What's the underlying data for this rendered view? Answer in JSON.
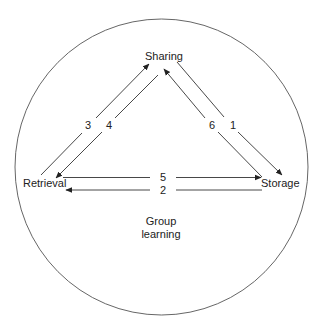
{
  "diagram": {
    "title": "Group learning",
    "boundary": {
      "shape": "circle",
      "label_line1": "Group",
      "label_line2": "learning"
    },
    "nodes": {
      "sharing": "Sharing",
      "retrieval": "Retrieval",
      "storage": "Storage"
    },
    "edges": [
      {
        "id": "1",
        "label": "1",
        "from": "Sharing",
        "to": "Storage"
      },
      {
        "id": "2",
        "label": "2",
        "from": "Storage",
        "to": "Retrieval"
      },
      {
        "id": "3",
        "label": "3",
        "from": "Retrieval",
        "to": "Sharing"
      },
      {
        "id": "4",
        "label": "4",
        "from": "Sharing",
        "to": "Retrieval"
      },
      {
        "id": "5",
        "label": "5",
        "from": "Retrieval",
        "to": "Storage"
      },
      {
        "id": "6",
        "label": "6",
        "from": "Storage",
        "to": "Sharing"
      }
    ],
    "colors": {
      "stroke": "#333333",
      "text": "#222222",
      "background": "#ffffff"
    }
  }
}
